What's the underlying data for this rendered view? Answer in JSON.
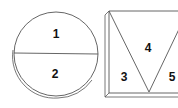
{
  "diagram": {
    "circle": {
      "regions": [
        {
          "id": "region-1",
          "label": "1"
        },
        {
          "id": "region-2",
          "label": "2"
        }
      ]
    },
    "square": {
      "regions": [
        {
          "id": "region-3",
          "label": "3"
        },
        {
          "id": "region-4",
          "label": "4"
        },
        {
          "id": "region-5",
          "label": "5"
        }
      ]
    },
    "colors": {
      "stroke": "#555555",
      "text": "#111111",
      "background": "#ffffff"
    }
  }
}
